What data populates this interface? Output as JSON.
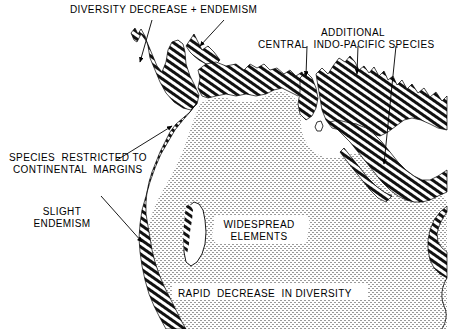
{
  "figure": {
    "domain": "map",
    "title_text": "",
    "background_color": "#ffffff",
    "ink_color": "#000000",
    "width": 450,
    "height": 329
  },
  "annotations": {
    "diversity_decrease": {
      "label": "DIVERSITY DECREASE + ENDEMISM",
      "x": 70,
      "y": 4,
      "align": "lft"
    },
    "additional_species_line1": {
      "label": "ADDITIONAL",
      "x": 265,
      "y": 27,
      "align": "ctr",
      "width": 176
    },
    "additional_species_line2": {
      "label": "CENTRAL  INDO-PACIFIC SPECIES",
      "x": 258,
      "y": 39,
      "align": "lft"
    },
    "species_restricted_line1": {
      "label": "SPECIES  RESTRICTED TO",
      "x": 9,
      "y": 152,
      "align": "lft"
    },
    "species_restricted_line2": {
      "label": "CONTINENTAL  MARGINS",
      "x": 13,
      "y": 164,
      "align": "lft"
    },
    "slight_endemism_line1": {
      "label": "SLIGHT",
      "x": 24,
      "y": 206,
      "align": "ctr",
      "width": 76
    },
    "slight_endemism_line2": {
      "label": "ENDEMISM",
      "x": 24,
      "y": 218,
      "align": "ctr",
      "width": 76
    },
    "widespread_elements_line1": {
      "label": "WIDESPREAD",
      "x": 218,
      "y": 219,
      "align": "ctr",
      "width": 82
    },
    "widespread_elements_line2": {
      "label": "ELEMENTS",
      "x": 218,
      "y": 231,
      "align": "ctr",
      "width": 82
    },
    "rapid_decrease": {
      "label": "RAPID  DECREASE  IN DIVERSITY",
      "x": 178,
      "y": 288,
      "align": "lft"
    }
  },
  "legend_regions": {
    "hatched_margin": "dense diagonal hatch band along continental margins",
    "stippled_interior": "light stipple fill over open ocean / widespread elements"
  },
  "leader_lines": [
    {
      "name": "arrow-diversity-left",
      "x1": 152,
      "y1": 20,
      "x2": 140,
      "y2": 64
    },
    {
      "name": "arrow-diversity-right",
      "x1": 222,
      "y1": 20,
      "x2": 199,
      "y2": 49
    },
    {
      "name": "arrow-additional-left",
      "x1": 307,
      "y1": 45,
      "x2": 306,
      "y2": 79
    },
    {
      "name": "arrow-additional-mid",
      "x1": 358,
      "y1": 45,
      "x2": 357,
      "y2": 77
    },
    {
      "name": "arrow-additional-right",
      "x1": 395,
      "y1": 45,
      "x2": 383,
      "y2": 168
    },
    {
      "name": "arrow-species-restricted",
      "x1": 118,
      "y1": 160,
      "x2": 174,
      "y2": 127
    },
    {
      "name": "arrow-slight-endemism",
      "x1": 102,
      "y1": 196,
      "x2": 144,
      "y2": 244
    }
  ]
}
